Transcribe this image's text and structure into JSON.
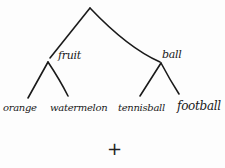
{
  "diagram": {
    "type": "tree",
    "style": "hand-drawn",
    "ink_color": "#1a1a1a",
    "background": "#fdfdfd",
    "root": {
      "label": "",
      "children": [
        {
          "label": "fruit",
          "children": [
            {
              "label": "orange"
            },
            {
              "label": "watermelon"
            }
          ]
        },
        {
          "label": "ball",
          "children": [
            {
              "label": "tennisball"
            },
            {
              "label": "football"
            }
          ]
        }
      ]
    },
    "nodes": {
      "fruit": "fruit",
      "ball": "ball"
    },
    "leaves": {
      "orange": "orange",
      "watermelon": "watermelon",
      "tennisball": "tennisball",
      "football": "football"
    },
    "symbol": "+"
  }
}
